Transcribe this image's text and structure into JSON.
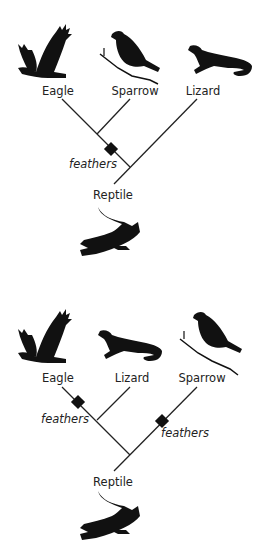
{
  "diagrams": [
    {
      "title": "Tree 1",
      "taxa": [
        {
          "label": "Eagle",
          "icon": "eagle-silhouette"
        },
        {
          "label": "Sparrow",
          "icon": "sparrow-silhouette"
        },
        {
          "label": "Lizard",
          "icon": "lizard-silhouette"
        }
      ],
      "traits": [
        {
          "label": "feathers",
          "marker": "diamond"
        }
      ],
      "root": {
        "label": "Reptile",
        "icon": "crocodile-silhouette"
      }
    },
    {
      "title": "Tree 2",
      "taxa": [
        {
          "label": "Eagle",
          "icon": "eagle-silhouette"
        },
        {
          "label": "Lizard",
          "icon": "lizard-silhouette"
        },
        {
          "label": "Sparrow",
          "icon": "sparrow-silhouette"
        }
      ],
      "traits": [
        {
          "label": "feathers",
          "marker": "diamond"
        },
        {
          "label": "feathers",
          "marker": "diamond"
        }
      ],
      "root": {
        "label": "Reptile",
        "icon": "crocodile-silhouette"
      }
    }
  ],
  "colors": {
    "line": "#222222",
    "silhouette": "#111111",
    "text": "#222222"
  }
}
